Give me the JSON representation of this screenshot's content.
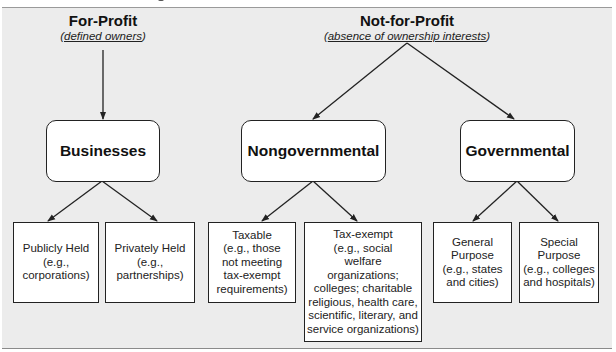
{
  "diagram": {
    "categories": {
      "for_profit": {
        "label": "For-Profit",
        "note": "defined owners"
      },
      "not_for_profit": {
        "label": "Not-for-Profit",
        "note": "absence of ownership interests"
      }
    },
    "groups": {
      "businesses": "Businesses",
      "nongovernmental": "Nongovernmental",
      "governmental": "Governmental"
    },
    "leaves": {
      "publicly_held": "Publicly Held\n(e.g.,\ncorporations)",
      "privately_held": "Privately Held\n(e.g.,\npartnerships)",
      "taxable": "Taxable\n(e.g., those\nnot meeting\ntax-exempt\nrequirements)",
      "tax_exempt": "Tax-exempt\n(e.g., social\nwelfare\norganizations;\ncolleges; charitable\nreligious, health care,\nscientific, literary, and\nservice organizations)",
      "general_purpose": "General\nPurpose\n(e.g., states\nand cities)",
      "special_purpose": "Special\nPurpose\n(e.g., colleges\nand hospitals)"
    },
    "edges": [
      [
        "For-Profit",
        "Businesses"
      ],
      [
        "Not-for-Profit",
        "Nongovernmental"
      ],
      [
        "Not-for-Profit",
        "Governmental"
      ],
      [
        "Businesses",
        "Publicly Held"
      ],
      [
        "Businesses",
        "Privately Held"
      ],
      [
        "Nongovernmental",
        "Taxable"
      ],
      [
        "Nongovernmental",
        "Tax-exempt"
      ],
      [
        "Governmental",
        "General Purpose"
      ],
      [
        "Governmental",
        "Special Purpose"
      ]
    ],
    "colors": {
      "panel_bg": "#ececec",
      "box_bg": "#ffffff",
      "stroke": "#222222"
    }
  }
}
